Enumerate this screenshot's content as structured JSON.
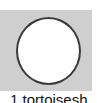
{
  "swatch": {
    "background_color": "#cfcfcf",
    "shape": "circle",
    "shape_fill": "#ffffff",
    "shape_border": "#3a3a3a"
  },
  "caption": {
    "text": "1 tortoisesh"
  }
}
